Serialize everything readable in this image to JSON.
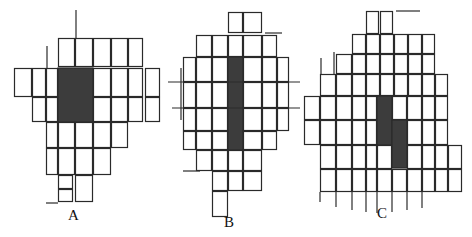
{
  "colors": {
    "line": "#2a2a2a",
    "fill": "#3c3c3c",
    "background": "#ffffff"
  },
  "panels": [
    {
      "id": "A",
      "label": "A",
      "cells": [
        [
          58,
          38,
          17,
          29
        ],
        [
          75,
          38,
          18,
          29
        ],
        [
          93,
          38,
          18,
          29
        ],
        [
          111,
          38,
          17,
          29
        ],
        [
          128,
          38,
          15,
          29
        ],
        [
          14,
          68,
          18,
          29
        ],
        [
          32,
          68,
          14,
          29
        ],
        [
          46,
          68,
          12,
          29
        ],
        [
          93,
          68,
          18,
          29
        ],
        [
          111,
          68,
          17,
          29
        ],
        [
          128,
          68,
          15,
          29
        ],
        [
          145,
          68,
          15,
          29
        ],
        [
          32,
          97,
          14,
          25
        ],
        [
          46,
          97,
          12,
          25
        ],
        [
          93,
          97,
          18,
          25
        ],
        [
          111,
          97,
          17,
          25
        ],
        [
          128,
          97,
          15,
          25
        ],
        [
          145,
          97,
          15,
          25
        ],
        [
          46,
          122,
          12,
          26
        ],
        [
          58,
          122,
          17,
          26
        ],
        [
          75,
          122,
          18,
          26
        ],
        [
          93,
          122,
          18,
          26
        ],
        [
          111,
          122,
          17,
          26
        ],
        [
          46,
          148,
          12,
          27
        ],
        [
          58,
          148,
          17,
          27
        ],
        [
          75,
          148,
          18,
          27
        ],
        [
          93,
          148,
          18,
          27
        ],
        [
          58,
          175,
          15,
          14
        ],
        [
          58,
          189,
          15,
          13
        ],
        [
          75,
          175,
          18,
          27
        ]
      ],
      "shaded": [
        [
          58,
          68,
          35,
          54
        ]
      ],
      "stray_lines": [
        [
          76,
          10,
          76,
          38
        ],
        [
          47,
          46,
          47,
          68
        ],
        [
          46,
          203,
          58,
          203
        ]
      ]
    },
    {
      "id": "B",
      "label": "B",
      "cells": [
        [
          228,
          12,
          15,
          21
        ],
        [
          243,
          12,
          19,
          21
        ],
        [
          196,
          35,
          16,
          22
        ],
        [
          212,
          35,
          16,
          22
        ],
        [
          228,
          35,
          15,
          22
        ],
        [
          243,
          35,
          19,
          22
        ],
        [
          262,
          35,
          15,
          22
        ],
        [
          183,
          57,
          13,
          25
        ],
        [
          196,
          57,
          16,
          25
        ],
        [
          212,
          57,
          16,
          25
        ],
        [
          243,
          57,
          19,
          25
        ],
        [
          262,
          57,
          15,
          25
        ],
        [
          277,
          57,
          12,
          25
        ],
        [
          183,
          82,
          13,
          26
        ],
        [
          196,
          82,
          16,
          26
        ],
        [
          212,
          82,
          16,
          26
        ],
        [
          243,
          82,
          19,
          26
        ],
        [
          262,
          82,
          15,
          26
        ],
        [
          277,
          82,
          12,
          26
        ],
        [
          183,
          108,
          13,
          23
        ],
        [
          196,
          108,
          16,
          23
        ],
        [
          212,
          108,
          16,
          23
        ],
        [
          243,
          108,
          19,
          23
        ],
        [
          262,
          108,
          15,
          23
        ],
        [
          277,
          108,
          12,
          23
        ],
        [
          183,
          131,
          13,
          19
        ],
        [
          196,
          131,
          16,
          19
        ],
        [
          212,
          131,
          16,
          19
        ],
        [
          243,
          131,
          19,
          19
        ],
        [
          262,
          131,
          15,
          19
        ],
        [
          196,
          150,
          16,
          21
        ],
        [
          212,
          150,
          16,
          21
        ],
        [
          228,
          150,
          15,
          21
        ],
        [
          243,
          150,
          19,
          21
        ],
        [
          212,
          171,
          16,
          20
        ],
        [
          228,
          171,
          15,
          20
        ],
        [
          243,
          171,
          19,
          20
        ],
        [
          212,
          191,
          16,
          26
        ]
      ],
      "shaded": [
        [
          228,
          57,
          15,
          93
        ]
      ],
      "stray_lines": [
        [
          172,
          108,
          300,
          108
        ],
        [
          168,
          82,
          300,
          82
        ],
        [
          181,
          68,
          181,
          120
        ],
        [
          183,
          171,
          200,
          171
        ],
        [
          265,
          33,
          282,
          33
        ]
      ]
    },
    {
      "id": "C",
      "label": "C",
      "cells": [
        [
          366,
          11,
          13,
          23
        ],
        [
          380,
          11,
          13,
          23
        ],
        [
          352,
          34,
          14,
          20
        ],
        [
          366,
          34,
          14,
          20
        ],
        [
          380,
          34,
          14,
          20
        ],
        [
          394,
          34,
          14,
          20
        ],
        [
          408,
          34,
          14,
          20
        ],
        [
          422,
          34,
          13,
          20
        ],
        [
          336,
          54,
          16,
          20
        ],
        [
          352,
          54,
          14,
          20
        ],
        [
          366,
          54,
          14,
          20
        ],
        [
          380,
          54,
          14,
          20
        ],
        [
          394,
          54,
          14,
          20
        ],
        [
          408,
          54,
          14,
          20
        ],
        [
          422,
          54,
          13,
          20
        ],
        [
          320,
          74,
          16,
          22
        ],
        [
          336,
          74,
          16,
          22
        ],
        [
          352,
          74,
          14,
          22
        ],
        [
          366,
          74,
          14,
          22
        ],
        [
          380,
          74,
          14,
          22
        ],
        [
          394,
          74,
          14,
          22
        ],
        [
          408,
          74,
          14,
          22
        ],
        [
          422,
          74,
          13,
          22
        ],
        [
          435,
          74,
          13,
          22
        ],
        [
          304,
          96,
          16,
          24
        ],
        [
          320,
          96,
          16,
          24
        ],
        [
          336,
          96,
          16,
          24
        ],
        [
          352,
          96,
          14,
          24
        ],
        [
          366,
          96,
          11,
          24
        ],
        [
          392,
          96,
          15,
          24
        ],
        [
          407,
          96,
          15,
          24
        ],
        [
          422,
          96,
          13,
          24
        ],
        [
          435,
          96,
          13,
          24
        ],
        [
          304,
          120,
          16,
          25
        ],
        [
          320,
          120,
          16,
          25
        ],
        [
          336,
          120,
          16,
          25
        ],
        [
          352,
          120,
          14,
          25
        ],
        [
          366,
          120,
          11,
          25
        ],
        [
          407,
          120,
          15,
          25
        ],
        [
          422,
          120,
          13,
          25
        ],
        [
          435,
          120,
          13,
          25
        ],
        [
          320,
          145,
          16,
          24
        ],
        [
          336,
          145,
          16,
          24
        ],
        [
          352,
          145,
          14,
          24
        ],
        [
          366,
          145,
          11,
          24
        ],
        [
          377,
          145,
          15,
          24
        ],
        [
          407,
          145,
          15,
          24
        ],
        [
          422,
          145,
          13,
          24
        ],
        [
          435,
          145,
          13,
          24
        ],
        [
          448,
          145,
          14,
          24
        ],
        [
          320,
          169,
          16,
          23
        ],
        [
          336,
          169,
          16,
          23
        ],
        [
          352,
          169,
          14,
          23
        ],
        [
          366,
          169,
          11,
          23
        ],
        [
          377,
          169,
          15,
          23
        ],
        [
          392,
          169,
          15,
          23
        ],
        [
          407,
          169,
          15,
          23
        ],
        [
          422,
          169,
          13,
          23
        ],
        [
          435,
          169,
          13,
          23
        ],
        [
          448,
          169,
          14,
          23
        ]
      ],
      "shaded": [
        [
          377,
          96,
          15,
          49
        ],
        [
          392,
          120,
          15,
          48
        ]
      ],
      "stray_lines": [
        [
          396,
          11,
          420,
          11
        ],
        [
          321,
          58,
          321,
          74
        ],
        [
          334,
          52,
          334,
          74
        ],
        [
          320,
          192,
          320,
          202
        ],
        [
          336,
          192,
          336,
          207
        ],
        [
          352,
          192,
          352,
          210
        ],
        [
          366,
          192,
          366,
          212
        ],
        [
          377,
          192,
          377,
          213
        ],
        [
          392,
          192,
          392,
          212
        ],
        [
          407,
          192,
          407,
          210
        ],
        [
          422,
          192,
          422,
          208
        ]
      ]
    }
  ]
}
